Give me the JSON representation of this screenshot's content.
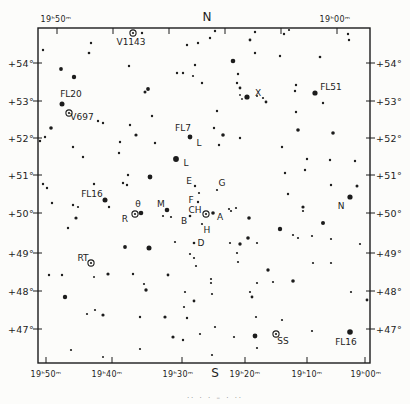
{
  "caption_partial": "·· · ·  – · ··",
  "chart_data": {
    "type": "scatter",
    "title": "",
    "colors": {
      "ink": "#1c1c1c",
      "paper": "#fcfcfa"
    },
    "frame": {
      "left": 38,
      "top": 28,
      "right": 370,
      "bottom": 363
    },
    "ra_labels_top": [
      {
        "text": "19ʰ50ᵐ",
        "x": 56
      },
      {
        "text": "N",
        "x": 207
      },
      {
        "text": "19ʰ00ᵐ",
        "x": 335
      }
    ],
    "ra_labels_bottom": [
      {
        "text": "19ʰ50ᵐ",
        "x": 46
      },
      {
        "text": "19ʰ40ᵐ",
        "x": 107
      },
      {
        "text": "19ʰ30ᵐ",
        "x": 178
      },
      {
        "text": "S",
        "x": 215
      },
      {
        "text": "19ʰ20ᵐ",
        "x": 245
      },
      {
        "text": "19ʰ10ᵐ",
        "x": 307
      },
      {
        "text": "19ʰ00ᵐ",
        "x": 366
      }
    ],
    "ra_ticks_top": [
      57,
      113,
      169,
      225,
      281,
      337
    ],
    "ra_ticks_bottom": [
      46,
      112,
      182,
      245,
      307,
      365
    ],
    "dec_ticks": [
      {
        "text": "+54°",
        "y": 63
      },
      {
        "text": "+53°",
        "y": 101
      },
      {
        "text": "+52°",
        "y": 138
      },
      {
        "text": "+51°",
        "y": 175
      },
      {
        "text": "+50°",
        "y": 213
      },
      {
        "text": "+49°",
        "y": 253
      },
      {
        "text": "+48°",
        "y": 291
      },
      {
        "text": "+47°",
        "y": 329
      }
    ],
    "star_labels": [
      {
        "text": "V1143",
        "x": 131,
        "y": 45
      },
      {
        "text": "FL20",
        "x": 71,
        "y": 97
      },
      {
        "text": "V697",
        "x": 82,
        "y": 120
      },
      {
        "text": "FL7",
        "x": 183,
        "y": 131
      },
      {
        "text": "L",
        "x": 199,
        "y": 146
      },
      {
        "text": "L",
        "x": 186,
        "y": 166
      },
      {
        "text": "FL16",
        "x": 92,
        "y": 197
      },
      {
        "text": "E",
        "x": 189,
        "y": 184
      },
      {
        "text": "G",
        "x": 222,
        "y": 186
      },
      {
        "text": "F",
        "x": 191,
        "y": 203
      },
      {
        "text": "θ",
        "x": 138,
        "y": 207
      },
      {
        "text": "M",
        "x": 161,
        "y": 207
      },
      {
        "text": "R",
        "x": 125,
        "y": 222
      },
      {
        "text": "CH",
        "x": 195,
        "y": 213
      },
      {
        "text": "A",
        "x": 220,
        "y": 220
      },
      {
        "text": "B",
        "x": 184,
        "y": 224
      },
      {
        "text": "H",
        "x": 207,
        "y": 233
      },
      {
        "text": "D",
        "x": 201,
        "y": 246
      },
      {
        "text": "RT",
        "x": 83,
        "y": 261
      },
      {
        "text": "X",
        "x": 258,
        "y": 96
      },
      {
        "text": "FL51",
        "x": 331,
        "y": 90
      },
      {
        "text": "N",
        "x": 341,
        "y": 209
      },
      {
        "text": "SS",
        "x": 283,
        "y": 344
      },
      {
        "text": "FL16",
        "x": 346,
        "y": 345
      }
    ],
    "variable_stars": [
      [
        133,
        33
      ],
      [
        69,
        113
      ],
      [
        135,
        214
      ],
      [
        206,
        214
      ],
      [
        91,
        263
      ],
      [
        276,
        334
      ]
    ],
    "stars": [
      [
        43,
        50,
        2.4
      ],
      [
        91,
        43,
        2.4
      ],
      [
        89,
        53,
        2.6
      ],
      [
        142,
        33,
        2.4
      ],
      [
        187,
        45,
        2.4
      ],
      [
        198,
        43,
        2.4
      ],
      [
        210,
        38,
        2.4
      ],
      [
        215,
        31,
        2.4
      ],
      [
        250,
        40,
        2.8
      ],
      [
        255,
        32,
        2.4
      ],
      [
        284,
        34,
        2.4
      ],
      [
        289,
        30,
        2.2
      ],
      [
        348,
        34,
        2.4
      ],
      [
        349,
        40,
        2.4
      ],
      [
        320,
        57,
        2.6
      ],
      [
        280,
        56,
        2.4
      ],
      [
        255,
        53,
        2.4
      ],
      [
        233,
        61,
        4.6
      ],
      [
        195,
        65,
        2.4
      ],
      [
        129,
        66,
        2.4
      ],
      [
        61,
        69,
        3.8
      ],
      [
        74,
        77,
        4.4
      ],
      [
        177,
        73,
        2.4
      ],
      [
        183,
        73,
        2.4
      ],
      [
        193,
        76,
        2.2
      ],
      [
        202,
        83,
        2.4
      ],
      [
        148,
        89,
        3.8
      ],
      [
        145,
        92,
        3.0
      ],
      [
        238,
        74,
        2.4
      ],
      [
        237,
        83,
        2.4
      ],
      [
        240,
        88,
        2.8
      ],
      [
        240,
        95,
        1.8
      ],
      [
        242,
        99,
        1.8
      ],
      [
        247,
        97,
        5.2
      ],
      [
        257,
        96,
        2.0
      ],
      [
        263,
        98,
        2.2
      ],
      [
        266,
        102,
        2.8
      ],
      [
        296,
        85,
        2.4
      ],
      [
        295,
        91,
        2.4
      ],
      [
        315,
        93,
        5.2
      ],
      [
        323,
        103,
        2.4
      ],
      [
        217,
        111,
        2.4
      ],
      [
        296,
        112,
        2.4
      ],
      [
        62,
        104,
        5.0
      ],
      [
        98,
        121,
        2.4
      ],
      [
        103,
        123,
        2.4
      ],
      [
        51,
        128,
        3.6
      ],
      [
        45,
        137,
        2.4
      ],
      [
        40,
        141,
        2.4
      ],
      [
        73,
        147,
        2.4
      ],
      [
        83,
        157,
        2.4
      ],
      [
        120,
        142,
        2.4
      ],
      [
        119,
        153,
        2.4
      ],
      [
        152,
        116,
        2.4
      ],
      [
        130,
        125,
        2.4
      ],
      [
        136,
        135,
        3.2
      ],
      [
        155,
        143,
        2.4
      ],
      [
        214,
        128,
        2.4
      ],
      [
        223,
        135,
        3.6
      ],
      [
        240,
        138,
        2.4
      ],
      [
        219,
        145,
        2.4
      ],
      [
        282,
        147,
        2.4
      ],
      [
        298,
        130,
        3.6
      ],
      [
        333,
        133,
        3.6
      ],
      [
        307,
        159,
        2.4
      ],
      [
        330,
        160,
        2.4
      ],
      [
        355,
        161,
        2.4
      ],
      [
        305,
        170,
        2.4
      ],
      [
        285,
        173,
        2.4
      ],
      [
        288,
        194,
        2.4
      ],
      [
        331,
        185,
        2.4
      ],
      [
        357,
        186,
        3.0
      ],
      [
        350,
        197,
        5.2
      ],
      [
        303,
        207,
        3.2
      ],
      [
        303,
        211,
        2.2
      ],
      [
        323,
        223,
        4.0
      ],
      [
        190,
        137,
        4.8
      ],
      [
        176,
        159,
        5.8
      ],
      [
        150,
        177,
        4.8
      ],
      [
        128,
        175,
        2.4
      ],
      [
        123,
        183,
        2.4
      ],
      [
        127,
        185,
        2.4
      ],
      [
        94,
        184,
        2.4
      ],
      [
        43,
        184,
        2.4
      ],
      [
        47,
        188,
        2.4
      ],
      [
        105,
        200,
        5.0
      ],
      [
        109,
        207,
        2.4
      ],
      [
        52,
        203,
        2.4
      ],
      [
        73,
        205,
        2.4
      ],
      [
        78,
        207,
        2.2
      ],
      [
        76,
        218,
        3.2
      ],
      [
        68,
        228,
        2.4
      ],
      [
        195,
        186,
        2.4
      ],
      [
        217,
        190,
        2.2
      ],
      [
        199,
        193,
        2.2
      ],
      [
        198,
        202,
        2.4
      ],
      [
        167,
        210,
        4.6
      ],
      [
        163,
        216,
        2.2
      ],
      [
        171,
        217,
        2.2
      ],
      [
        141,
        213,
        4.6
      ],
      [
        213,
        213,
        3.6
      ],
      [
        190,
        216,
        2.6
      ],
      [
        202,
        224,
        2.2
      ],
      [
        229,
        209,
        2.2
      ],
      [
        231,
        211,
        2.2
      ],
      [
        236,
        208,
        2.2
      ],
      [
        249,
        218,
        3.6
      ],
      [
        248,
        238,
        3.6
      ],
      [
        280,
        229,
        4.4
      ],
      [
        293,
        235,
        2.2
      ],
      [
        298,
        238,
        2.2
      ],
      [
        312,
        236,
        2.2
      ],
      [
        331,
        239,
        2.2
      ],
      [
        360,
        244,
        2.2
      ],
      [
        194,
        243,
        2.6
      ],
      [
        175,
        242,
        2.2
      ],
      [
        125,
        247,
        3.8
      ],
      [
        149,
        248,
        5.0
      ],
      [
        230,
        243,
        2.2
      ],
      [
        240,
        244,
        3.4
      ],
      [
        257,
        243,
        2.2
      ],
      [
        190,
        254,
        2.2
      ],
      [
        194,
        258,
        2.2
      ],
      [
        237,
        253,
        2.2
      ],
      [
        238,
        262,
        2.2
      ],
      [
        196,
        266,
        2.2
      ],
      [
        168,
        275,
        2.8
      ],
      [
        268,
        270,
        3.4
      ],
      [
        211,
        279,
        2.2
      ],
      [
        211,
        283,
        2.2
      ],
      [
        146,
        290,
        3.4
      ],
      [
        257,
        283,
        2.2
      ],
      [
        273,
        282,
        2.2
      ],
      [
        185,
        292,
        2.2
      ],
      [
        212,
        294,
        2.2
      ],
      [
        250,
        292,
        2.2
      ],
      [
        252,
        297,
        2.8
      ],
      [
        194,
        301,
        2.8
      ],
      [
        184,
        307,
        2.2
      ],
      [
        49,
        275,
        2.4
      ],
      [
        62,
        275,
        2.4
      ],
      [
        94,
        277,
        2.0
      ],
      [
        108,
        274,
        3.2
      ],
      [
        133,
        274,
        2.4
      ],
      [
        144,
        284,
        2.2
      ],
      [
        65,
        297,
        4.4
      ],
      [
        87,
        314,
        2.2
      ],
      [
        95,
        310,
        2.2
      ],
      [
        103,
        315,
        3.2
      ],
      [
        140,
        317,
        2.4
      ],
      [
        165,
        317,
        3.2
      ],
      [
        187,
        318,
        2.4
      ],
      [
        256,
        317,
        2.2
      ],
      [
        282,
        320,
        2.2
      ],
      [
        215,
        327,
        2.2
      ],
      [
        313,
        263,
        2.2
      ],
      [
        331,
        263,
        2.2
      ],
      [
        293,
        281,
        3.6
      ],
      [
        351,
        292,
        2.2
      ],
      [
        367,
        300,
        2.8
      ],
      [
        312,
        331,
        2.2
      ],
      [
        350,
        332,
        5.6
      ],
      [
        255,
        336,
        4.8
      ],
      [
        234,
        337,
        2.2
      ],
      [
        173,
        337,
        3.2
      ],
      [
        183,
        340,
        2.4
      ],
      [
        200,
        334,
        2.2
      ],
      [
        71,
        350,
        2.2
      ],
      [
        103,
        357,
        2.0
      ],
      [
        140,
        349,
        2.2
      ],
      [
        257,
        348,
        2.2
      ],
      [
        212,
        355,
        2.2
      ]
    ]
  }
}
